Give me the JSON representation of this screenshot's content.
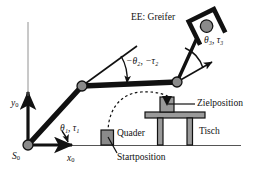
{
  "figure": {
    "language": "de",
    "background_color": "#ffffff",
    "ink_color": "#111111",
    "link_gray": "#8a8a8a",
    "object_gray": "#9a9a9a",
    "joint_gray": "#8a8a8a"
  },
  "labels": {
    "end_effector": "EE: Greifer",
    "joint3": "θ₃, τ₃",
    "joint2": "−θ₂, −τ₂",
    "joint1": "θ₁, τ₁",
    "axis_y": "y",
    "axis_y_sub": "0",
    "axis_x": "x",
    "axis_x_sub": "0",
    "origin": "S",
    "origin_sub": "0",
    "target_position": "Zielposition",
    "start_position": "Startposition",
    "block": "Quader",
    "table": "Tisch"
  },
  "geometry": {
    "origin": {
      "x": 28,
      "y": 145
    },
    "elbow_joint": {
      "x": 82,
      "y": 86
    },
    "wrist_joint": {
      "x": 177,
      "y": 82
    },
    "gripper_center": {
      "x": 207,
      "y": 27
    },
    "ground_line_y": 145,
    "ground_line_x_start": 28,
    "ground_line_x_end": 240,
    "y_axis_top": 88,
    "x_axis_tip": 78,
    "block_start": {
      "x": 101,
      "y": 130,
      "w": 12,
      "h": 15
    },
    "block_target": {
      "x": 160,
      "y": 97,
      "w": 14,
      "h": 16
    },
    "table_top": {
      "x": 146,
      "y": 112,
      "w": 59,
      "h": 6
    },
    "table_leg_left": {
      "x": 158,
      "y": 118,
      "w": 5,
      "h": 27
    },
    "table_leg_right": {
      "x": 188,
      "y": 118,
      "w": 5,
      "h": 27
    },
    "trajectory": "dashed arc from start block to target block"
  },
  "icons": {
    "joint": "revolute-joint-icon",
    "gripper": "gripper-icon",
    "arrow": "arrow-icon",
    "arc": "angle-arc-icon"
  }
}
